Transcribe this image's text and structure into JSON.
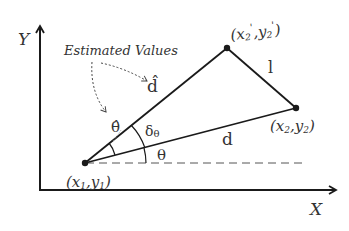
{
  "diagram": {
    "axes": {
      "x_label": "X",
      "y_label": "Y"
    },
    "points": {
      "p1": {
        "label_x": "x",
        "label_x_sub": "1",
        "sep": ",",
        "label_y": "y",
        "label_y_sub": "1",
        "open": "(",
        "close": ")"
      },
      "p2": {
        "label_x": "x",
        "label_x_sub": "2",
        "sep": ",",
        "label_y": "y",
        "label_y_sub": "2",
        "open": "(",
        "close": ")"
      },
      "p2_prime": {
        "label_x": "x",
        "label_x_sub": "2",
        "label_x_prime": "'",
        "sep": ",",
        "label_y": "y",
        "label_y_sub": "2",
        "label_y_prime": "'",
        "open": "(",
        "close": ")"
      }
    },
    "segments": {
      "d_hat": "d̂",
      "d": "d",
      "l": "l"
    },
    "angles": {
      "theta_hat": "θ̂",
      "delta_theta": "δ",
      "delta_theta_sub": "θ",
      "theta": "θ"
    },
    "annotation": {
      "estimated_values": "Estimated Values"
    },
    "colors": {
      "line": "#1a1a1a",
      "text": "#333333",
      "dashed": "#555555"
    }
  }
}
